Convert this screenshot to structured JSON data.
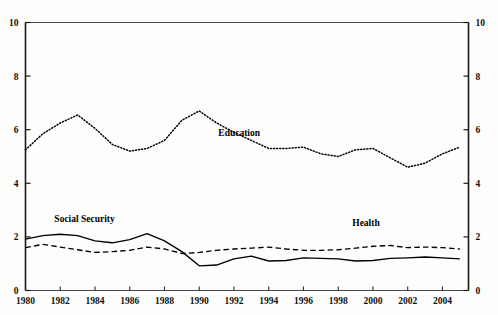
{
  "chart_data": {
    "type": "line",
    "title": "",
    "subtitle": "",
    "xlabel": "",
    "ylabel": "",
    "xlim": [
      1980,
      2005.5
    ],
    "ylim": [
      0,
      10
    ],
    "grid": false,
    "legend_position": "inline-annotations",
    "left_axis": {
      "ticks": [
        0,
        2,
        4,
        6,
        8,
        10
      ],
      "tick_labels": [
        "0",
        "2",
        "4",
        "6",
        "8",
        "10"
      ]
    },
    "right_axis": {
      "ticks": [
        0,
        2,
        4,
        6,
        8,
        10
      ],
      "tick_labels": [
        "0",
        "2",
        "4",
        "6",
        "8",
        "10"
      ]
    },
    "x_tick_labels": [
      "1980",
      "1982",
      "1984",
      "1986",
      "1988",
      "1990",
      "1992",
      "1994",
      "1996",
      "1998",
      "2000",
      "2002",
      "2004"
    ],
    "x_tick_values": [
      1980,
      1982,
      1984,
      1986,
      1988,
      1990,
      1992,
      1994,
      1996,
      1998,
      2000,
      2002,
      2004
    ],
    "x": [
      1980,
      1981,
      1982,
      1983,
      1984,
      1985,
      1986,
      1987,
      1988,
      1989,
      1990,
      1991,
      1992,
      1993,
      1994,
      1995,
      1996,
      1997,
      1998,
      1999,
      2000,
      2001,
      2002,
      2003,
      2004,
      2005
    ],
    "series": [
      {
        "name": "Education",
        "style": "dotted",
        "color": "#000000",
        "label_x": 1992.3,
        "label_y": 5.75,
        "values": [
          5.25,
          5.85,
          6.25,
          6.55,
          6.05,
          5.45,
          5.2,
          5.3,
          5.6,
          6.35,
          6.7,
          6.25,
          5.9,
          5.6,
          5.3,
          5.3,
          5.35,
          5.1,
          5.0,
          5.25,
          5.3,
          4.95,
          4.6,
          4.75,
          5.1,
          5.35
        ]
      },
      {
        "name": "Social Security",
        "style": "solid",
        "color": "#000000",
        "label_x": 1983.4,
        "label_y": 2.55,
        "values": [
          1.92,
          2.05,
          2.1,
          2.05,
          1.85,
          1.78,
          1.9,
          2.12,
          1.85,
          1.45,
          0.92,
          0.95,
          1.18,
          1.28,
          1.1,
          1.12,
          1.22,
          1.2,
          1.18,
          1.1,
          1.12,
          1.2,
          1.22,
          1.25,
          1.22,
          1.18
        ]
      },
      {
        "name": "Health",
        "style": "dashed",
        "color": "#000000",
        "label_x": 1999.6,
        "label_y": 2.4,
        "values": [
          1.6,
          1.72,
          1.62,
          1.52,
          1.42,
          1.45,
          1.5,
          1.62,
          1.55,
          1.38,
          1.42,
          1.5,
          1.55,
          1.58,
          1.62,
          1.55,
          1.5,
          1.5,
          1.52,
          1.58,
          1.65,
          1.68,
          1.6,
          1.62,
          1.6,
          1.55
        ]
      }
    ]
  },
  "figure": {
    "caption": "",
    "note": ""
  }
}
